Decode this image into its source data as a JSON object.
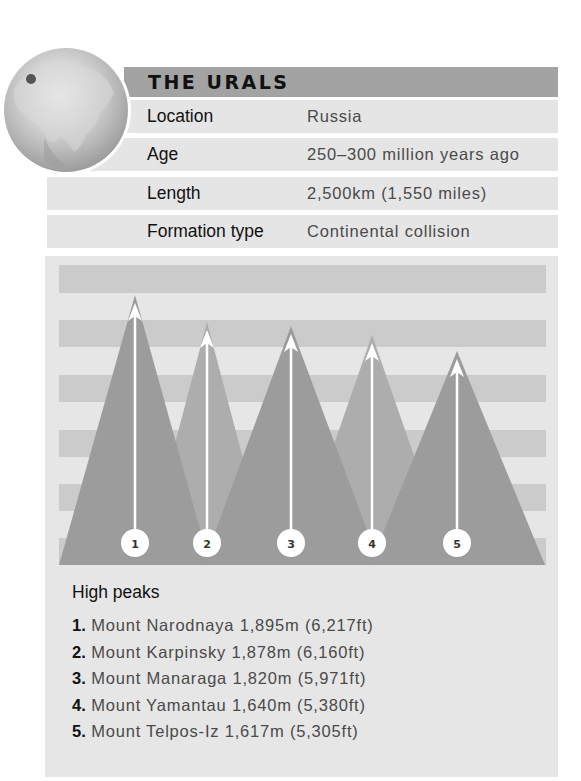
{
  "header": {
    "title": "THE URALS"
  },
  "facts": [
    {
      "label": "Location",
      "value": "Russia"
    },
    {
      "label": "Age",
      "value": "250–300 million years ago"
    },
    {
      "label": "Length",
      "value": "2,500km (1,550 miles)"
    },
    {
      "label": "Formation type",
      "value": "Continental collision"
    }
  ],
  "globe": {
    "icon": "globe-icon",
    "marker": "location-marker-icon"
  },
  "diagram": {
    "peaks": [
      {
        "number": "1",
        "apex_x": 135,
        "apex_y": 295,
        "base_left": 59,
        "base_right": 210,
        "shade": "dark"
      },
      {
        "number": "2",
        "apex_x": 207,
        "apex_y": 322,
        "base_left": 143,
        "base_right": 271,
        "shade": "light"
      },
      {
        "number": "3",
        "apex_x": 291,
        "apex_y": 326,
        "base_left": 203,
        "base_right": 380,
        "shade": "dark"
      },
      {
        "number": "4",
        "apex_x": 372,
        "apex_y": 335,
        "base_left": 292,
        "base_right": 452,
        "shade": "light"
      },
      {
        "number": "5",
        "apex_x": 457,
        "apex_y": 351,
        "base_left": 370,
        "base_right": 545,
        "shade": "dark"
      }
    ],
    "colors": {
      "dark": "#9c9c9c",
      "light": "#adadad",
      "stripe_dark": "#cbcbcb",
      "stripe_light": "#e2e2e2"
    }
  },
  "high_peaks": {
    "title": "High peaks",
    "items": [
      {
        "num": "1.",
        "text": "Mount Narodnaya 1,895m (6,217ft)"
      },
      {
        "num": "2.",
        "text": "Mount Karpinsky 1,878m (6,160ft)"
      },
      {
        "num": "3.",
        "text": "Mount Manaraga 1,820m (5,971ft)"
      },
      {
        "num": "4.",
        "text": "Mount Yamantau 1,640m (5,380ft)"
      },
      {
        "num": "5.",
        "text": "Mount Telpos-Iz 1,617m (5,305ft)"
      }
    ]
  }
}
